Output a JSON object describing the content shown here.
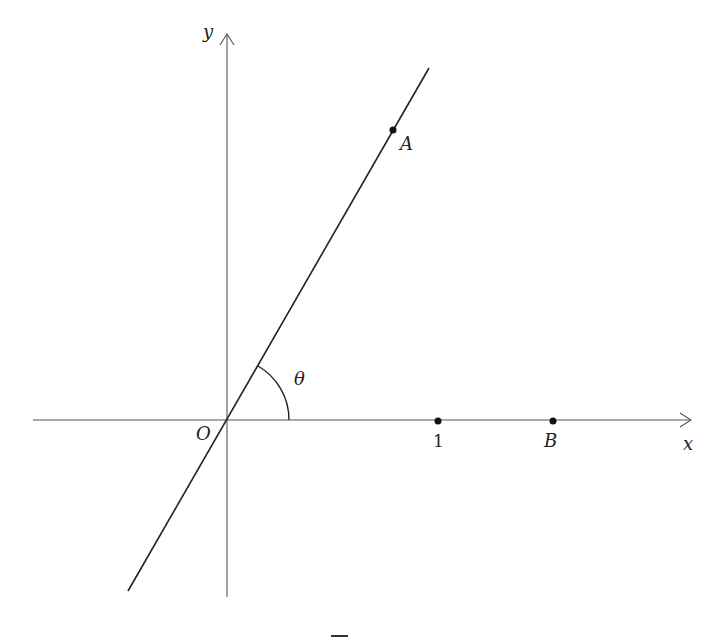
{
  "diagram": {
    "type": "coordinate-plane",
    "axes": {
      "x_label": "x",
      "y_label": "y",
      "origin_label": "O"
    },
    "line": {
      "description": "line through origin O and point A",
      "angle_label": "θ"
    },
    "points": [
      {
        "name": "A",
        "label": "A",
        "on": "line"
      },
      {
        "name": "one",
        "label": "1",
        "on": "x-axis"
      },
      {
        "name": "B",
        "label": "B",
        "on": "x-axis"
      }
    ],
    "footer_mark": ""
  },
  "colors": {
    "stroke": "#222222",
    "axis": "#555555",
    "background": "#ffffff"
  }
}
